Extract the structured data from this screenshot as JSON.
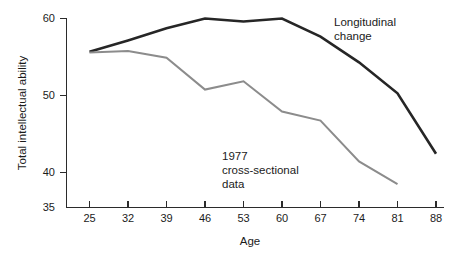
{
  "chart_data": {
    "type": "line",
    "title": "",
    "xlabel": "Age",
    "ylabel": "Total intellectual ability",
    "x": [
      25,
      32,
      39,
      46,
      53,
      60,
      67,
      74,
      81,
      88
    ],
    "xtick_labels": [
      "25",
      "32",
      "39",
      "46",
      "53",
      "60",
      "67",
      "74",
      "81",
      "88"
    ],
    "ytick_values": [
      35,
      40,
      50,
      60
    ],
    "ytick_labels": [
      "35",
      "40",
      "50",
      "60"
    ],
    "xlim": [
      21.5,
      91.5
    ],
    "ylim": [
      35,
      60
    ],
    "grid": false,
    "legend_position": "inline-annotations",
    "series": [
      {
        "name": "Longitudinal change",
        "color": "#262626",
        "x": [
          25,
          32,
          39,
          46,
          53,
          60,
          67,
          74,
          81,
          88
        ],
        "values": [
          55.6,
          57.1,
          58.7,
          60.0,
          59.6,
          60.0,
          57.6,
          54.2,
          50.1,
          42.1
        ]
      },
      {
        "name": "1977 cross-sectional data",
        "color": "#8c8c8c",
        "x": [
          25,
          32,
          39,
          46,
          53,
          60,
          67,
          74,
          81
        ],
        "values": [
          55.5,
          55.7,
          54.8,
          50.6,
          51.7,
          47.7,
          46.5,
          41.1,
          38.1
        ]
      }
    ],
    "annotations": [
      {
        "name": "longitudinal-label",
        "lines": [
          "Longitudinal",
          "change"
        ],
        "x_px": 334,
        "y_px": 26
      },
      {
        "name": "cross-sectional-label",
        "lines": [
          "1977",
          "cross-sectional",
          "data"
        ],
        "x_px": 222,
        "y_px": 160
      }
    ]
  },
  "axes": {
    "y_title": "Total intellectual ability",
    "x_title": "Age"
  }
}
